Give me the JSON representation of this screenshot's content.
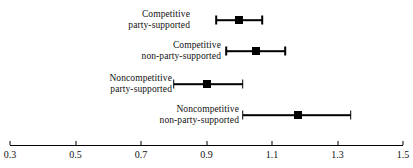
{
  "chart_data": {
    "type": "scatter",
    "subtype": "forest-plot",
    "title": "",
    "xlabel": "",
    "ylabel": "",
    "xlim": [
      0.3,
      1.5
    ],
    "xticks": [
      0.3,
      0.5,
      0.7,
      0.9,
      1.1,
      1.3,
      1.5
    ],
    "xtick_labels": [
      "0.3",
      "0.5",
      "0.7",
      "0.9",
      "1.1",
      "1.3",
      "1.5"
    ],
    "grid": false,
    "legend": "none",
    "marker_color": "#000000",
    "line_color": "#000000",
    "categories": [
      "Competitive party-supported",
      "Competitive non-party-supported",
      "Noncompetitive party-supported",
      "Noncompetitive non-party-supported"
    ],
    "points": [
      {
        "label_line1": "Competitive",
        "label_line2": "party-supported",
        "estimate": 1.0,
        "ci_low": 0.93,
        "ci_high": 1.07
      },
      {
        "label_line1": "Competitive",
        "label_line2": "non-party-supported",
        "estimate": 1.05,
        "ci_low": 0.96,
        "ci_high": 1.14
      },
      {
        "label_line1": "Noncompetitive",
        "label_line2": "party-supported",
        "estimate": 0.9,
        "ci_low": 0.8,
        "ci_high": 1.01
      },
      {
        "label_line1": "Noncompetitive",
        "label_line2": "non-party-supported",
        "estimate": 1.18,
        "ci_low": 1.01,
        "ci_high": 1.34
      }
    ]
  },
  "axis": {
    "min_label": "0.3",
    "max_label": "1.5"
  }
}
